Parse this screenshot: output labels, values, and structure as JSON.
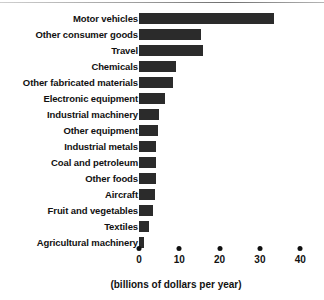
{
  "chart_data": {
    "type": "bar",
    "orientation": "horizontal",
    "title": "",
    "subtitle": "",
    "xlabel": "(billions of dollars per year)",
    "ylabel": "",
    "xlim": [
      0,
      40
    ],
    "xticks": [
      0,
      10,
      20,
      30,
      40
    ],
    "xtick_labels": [
      "0",
      "10",
      "20",
      "30",
      "40"
    ],
    "grid": false,
    "legend": null,
    "bar_color": "#2b2b2b",
    "categories": [
      "Motor vehicles",
      "Other consumer goods",
      "Travel",
      "Chemicals",
      "Other fabricated materials",
      "Electronic equipment",
      "Industrial machinery",
      "Other equipment",
      "Industrial metals",
      "Coal and petroleum",
      "Other foods",
      "Aircraft",
      "Fruit and vegetables",
      "Textiles",
      "Agricultural machinery"
    ],
    "values": [
      33.5,
      15.5,
      16,
      9.2,
      8.5,
      6.5,
      5,
      4.8,
      4.3,
      4.2,
      4.2,
      4,
      3.5,
      2.5,
      1.3
    ],
    "units": "billions of dollars per year"
  },
  "axis": {
    "caption": "(billions of dollars per year)"
  }
}
